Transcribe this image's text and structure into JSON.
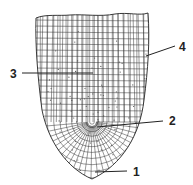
{
  "diagram": {
    "labels": [
      {
        "id": "1",
        "text": "1",
        "x": 133,
        "y": 176,
        "line": [
          95,
          172,
          127,
          171
        ]
      },
      {
        "id": "2",
        "text": "2",
        "x": 169,
        "y": 125,
        "line": [
          97,
          127,
          163,
          121
        ]
      },
      {
        "id": "3",
        "text": "3",
        "x": 10,
        "y": 78,
        "line": [
          22,
          73,
          93,
          73
        ]
      },
      {
        "id": "4",
        "text": "4",
        "x": 179,
        "y": 51,
        "line": [
          146,
          56,
          175,
          46
        ]
      }
    ],
    "colors": {
      "ink": "#222222",
      "background": "#ffffff"
    }
  }
}
